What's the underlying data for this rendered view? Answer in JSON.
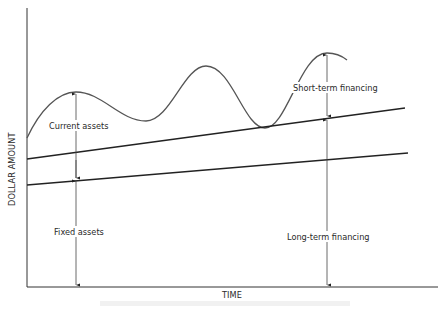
{
  "diagram": {
    "type": "financing-strategy-diagram",
    "axes": {
      "y_label": "DOLLAR AMOUNT",
      "x_label": "TIME"
    },
    "series": [
      {
        "name": "total-assets-curve",
        "description": "Fluctuating total assets (fixed + current)",
        "style": "wavy"
      },
      {
        "name": "long-term-financing-line",
        "description": "Level of long-term financing",
        "style": "straight-rising"
      },
      {
        "name": "fixed-assets-line",
        "description": "Level of fixed assets",
        "style": "straight-rising"
      }
    ],
    "labels": {
      "current_assets": "Current assets",
      "fixed_assets": "Fixed assets",
      "short_term_financing": "Short-term financing",
      "long_term_financing": "Long-term financing"
    },
    "caption": ""
  },
  "colors": {
    "line": "#2b2b2b",
    "arrow": "#3a3a3a",
    "text": "#2a2a2a",
    "background": "#ffffff"
  }
}
